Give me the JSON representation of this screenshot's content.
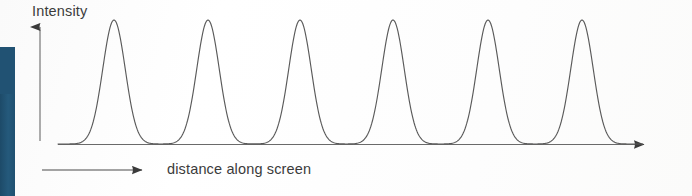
{
  "figure": {
    "type": "diffraction-intensity-pattern",
    "background_color": "#fdfdfc",
    "ink_color": "#4a4a4a",
    "text_color": "#3b3b3b",
    "left_bar_color": "#215273"
  },
  "axes": {
    "y_label": "Intensity",
    "x_label": "distance along screen",
    "y_axis": {
      "x": 40,
      "top": 26,
      "bottom": 141,
      "arrow": "up"
    },
    "x_axis": {
      "y": 144,
      "left": 58,
      "right": 655,
      "arrow": "right"
    },
    "direction_arrow": {
      "y": 170,
      "left": 42,
      "right": 152,
      "arrow": "right"
    }
  },
  "chart_data": {
    "type": "line",
    "title": "",
    "xlabel": "distance along screen",
    "ylabel": "Intensity",
    "grid": false,
    "legend": null,
    "axis_ticks": {
      "x": [],
      "y": []
    },
    "xlim": [
      58,
      655
    ],
    "ylim": [
      0,
      1
    ],
    "baseline_y": 144,
    "peak_top_y": 20,
    "peak_count": 6,
    "peak_centers_px": [
      114,
      208,
      300,
      393,
      488,
      582
    ],
    "peak_spacing_px": 94,
    "peak_half_width_px": 23,
    "peak_heights": [
      1,
      1,
      1,
      1,
      1,
      1
    ],
    "series": [
      {
        "name": "intensity",
        "x": [
          114,
          208,
          300,
          393,
          488,
          582
        ],
        "values": [
          1,
          1,
          1,
          1,
          1,
          1
        ]
      }
    ]
  }
}
